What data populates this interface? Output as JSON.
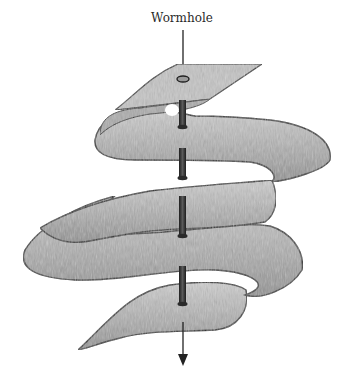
{
  "diagram": {
    "label": "Wormhole",
    "colors": {
      "sheet_fill": "#b9b9b9",
      "sheet_shade": "#8c8c8c",
      "outline": "#2b2b2b",
      "tube": "#3a3a3a",
      "background": "#ffffff"
    },
    "arrow_direction": "down"
  }
}
